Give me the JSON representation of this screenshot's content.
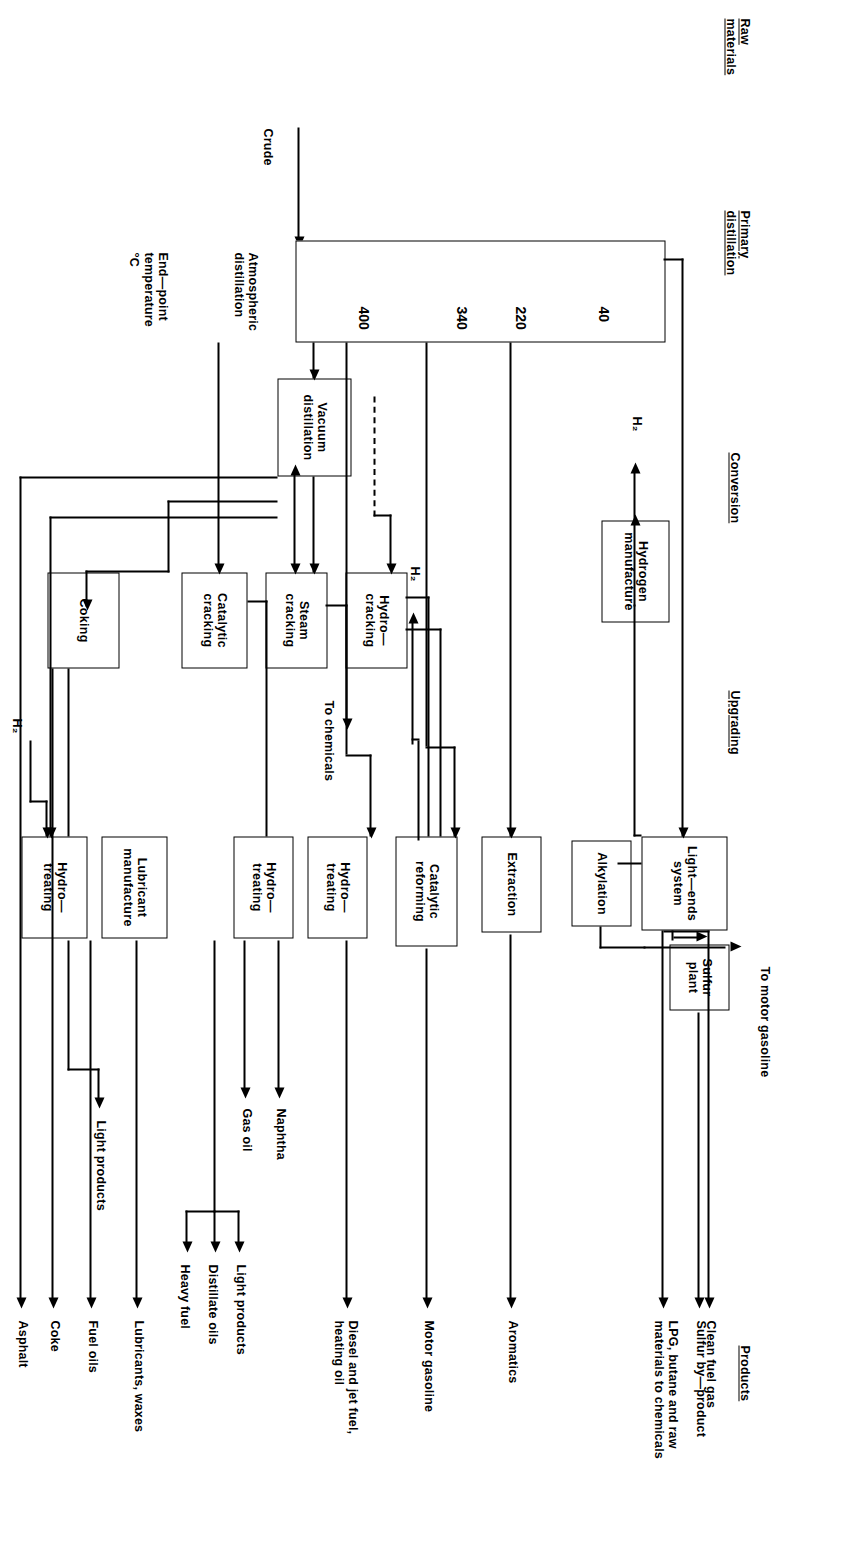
{
  "diagram": {
    "orientation": "rotated-90-clockwise",
    "line_color": "#000000",
    "background_color": "#ffffff"
  },
  "section_headers": [
    {
      "id": "raw",
      "label": "Raw\nmaterials",
      "underlined": true
    },
    {
      "id": "primary",
      "label": "Primary\ndistillation",
      "underlined": true
    },
    {
      "id": "conversion",
      "label": "Conversion",
      "underlined": true
    },
    {
      "id": "upgrading",
      "label": "Upgrading",
      "underlined": true
    },
    {
      "id": "products",
      "label": "Products",
      "underlined": true
    }
  ],
  "feed": {
    "crude_label": "Crude",
    "column_label": "Atmospheric\ndistillation",
    "endpoint_label": "End—point\ntemperature\n°C"
  },
  "cut_temperatures": [
    {
      "value": "40"
    },
    {
      "value": "220"
    },
    {
      "value": "340"
    },
    {
      "value": "400"
    }
  ],
  "units": {
    "vacuum_distillation": "Vacuum\ndistillation",
    "light_ends_system": "Light—ends\nsystem",
    "sulfur_plant": "Sulfur\nplant",
    "alkylation": "Alkylation",
    "extraction": "Extraction",
    "catalytic_reforming": "Catalytic\nreforming",
    "hydrogen_manufacture": "Hydrogen\nmanufacture",
    "hydrocracking": "Hydro—\ncracking",
    "steam_cracking": "Steam\ncracking",
    "catalytic_cracking": "Catalytic\ncracking",
    "coking": "Coking",
    "hydrotreating_1": "Hydro—\ntreating",
    "hydrotreating_2": "Hydro—\ntreating",
    "hydrotreating_3": "Hydro—\ntreating",
    "lubricant_manufacture": "Lubricant\nmanufacture"
  },
  "products": [
    {
      "id": "clean-fuel-gas",
      "label": "Clean fuel gas"
    },
    {
      "id": "lpg-butane",
      "label": "LPG, butane and raw\nmaterials to chemicals"
    },
    {
      "id": "sulfur-by-product",
      "label": "Sulfur by—product"
    },
    {
      "id": "aromatics",
      "label": "Aromatics"
    },
    {
      "id": "motor-gasoline",
      "label": "Motor gasoline"
    },
    {
      "id": "diesel-jet-heating",
      "label": "Diesel and jet fuel,\nheating oil"
    },
    {
      "id": "lubricants-waxes",
      "label": "Lubricants, waxes"
    },
    {
      "id": "fuel-oils",
      "label": "Fuel oils"
    },
    {
      "id": "coke",
      "label": "Coke"
    },
    {
      "id": "asphalt",
      "label": "Asphalt"
    }
  ],
  "stream_labels": [
    {
      "id": "to-motor-gasoline",
      "label": "To motor gasoline"
    },
    {
      "id": "h2-from-reforming",
      "label": "H₂"
    },
    {
      "id": "h2-from-manufacture",
      "label": "H₂"
    },
    {
      "id": "h2-to-hydrotreating",
      "label": "H₂"
    },
    {
      "id": "to-chemicals",
      "label": "To chemicals"
    },
    {
      "id": "naphtha",
      "label": "Naphtha"
    },
    {
      "id": "gas-oil",
      "label": "Gas oil"
    },
    {
      "id": "light-products-cat",
      "label": "Light products"
    },
    {
      "id": "distillate-oils",
      "label": "Distillate oils"
    },
    {
      "id": "heavy-fuel",
      "label": "Heavy fuel"
    },
    {
      "id": "light-products-coker",
      "label": "Light products"
    }
  ]
}
